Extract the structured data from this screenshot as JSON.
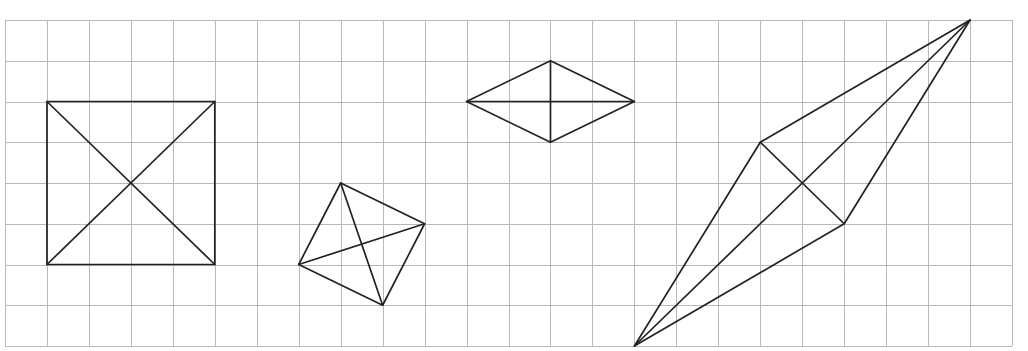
{
  "grid": {
    "origin_x": 5,
    "origin_y": 20,
    "cols": 24,
    "rows": 8,
    "cell_w": 41.96,
    "cell_h": 40.75,
    "line_color": "#b9b9b9",
    "shape_color": "#222222"
  },
  "shapes": [
    {
      "name": "square-with-diagonals",
      "vertices": [
        [
          1,
          2
        ],
        [
          5,
          2
        ],
        [
          5,
          6
        ],
        [
          1,
          6
        ]
      ],
      "diagonals": [
        [
          [
            1,
            2
          ],
          [
            5,
            6
          ]
        ],
        [
          [
            5,
            2
          ],
          [
            1,
            6
          ]
        ]
      ]
    },
    {
      "name": "tilted-square-with-diagonals",
      "vertices": [
        [
          8,
          4
        ],
        [
          10,
          5
        ],
        [
          9,
          7
        ],
        [
          7,
          6
        ]
      ],
      "diagonals": [
        [
          [
            8,
            4
          ],
          [
            9,
            7
          ]
        ],
        [
          [
            7,
            6
          ],
          [
            10,
            5
          ]
        ]
      ]
    },
    {
      "name": "rhombus-with-diagonals",
      "vertices": [
        [
          11,
          2
        ],
        [
          13,
          1
        ],
        [
          15,
          2
        ],
        [
          13,
          3
        ]
      ],
      "diagonals": [
        [
          [
            11,
            2
          ],
          [
            15,
            2
          ]
        ],
        [
          [
            13,
            1
          ],
          [
            13,
            3
          ]
        ]
      ]
    },
    {
      "name": "kite-with-diagonals",
      "vertices": [
        [
          15,
          8
        ],
        [
          18,
          3
        ],
        [
          23,
          0
        ],
        [
          20,
          5
        ]
      ],
      "diagonals": [
        [
          [
            15,
            8
          ],
          [
            23,
            0
          ]
        ],
        [
          [
            18,
            3
          ],
          [
            20,
            5
          ]
        ]
      ]
    }
  ]
}
